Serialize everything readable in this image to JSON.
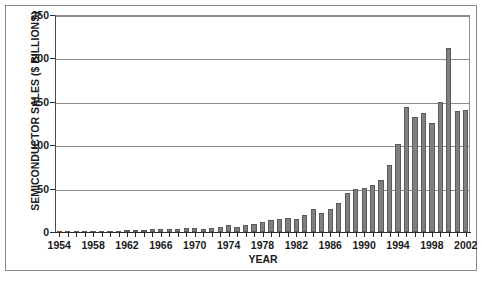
{
  "chart_data": {
    "type": "bar",
    "title": "",
    "xlabel": "YEAR",
    "ylabel": "SEMICONDUCTOR SALES ($ BILLIONS)",
    "ylim": [
      0,
      250
    ],
    "yticks": [
      0,
      50,
      100,
      150,
      200,
      250
    ],
    "ytick_labels": [
      "0",
      "50",
      "100",
      "150",
      "200",
      "250"
    ],
    "xlim": [
      1954,
      2002
    ],
    "xtick_labels": [
      "1954",
      "1958",
      "1962",
      "1966",
      "1970",
      "1974",
      "1978",
      "1982",
      "1986",
      "1990",
      "1994",
      "1998",
      "2002"
    ],
    "grid": "horizontal",
    "legend": "none",
    "bar_color": "#808080",
    "bar_edge_color": "#5a5a5a",
    "gridline_color": "#8c8c8c",
    "axis_color": "#2b2b2b",
    "categories": [
      "1954",
      "1955",
      "1956",
      "1957",
      "1958",
      "1959",
      "1960",
      "1961",
      "1962",
      "1963",
      "1964",
      "1965",
      "1966",
      "1967",
      "1968",
      "1969",
      "1970",
      "1971",
      "1972",
      "1973",
      "1974",
      "1975",
      "1976",
      "1977",
      "1978",
      "1979",
      "1980",
      "1981",
      "1982",
      "1983",
      "1984",
      "1985",
      "1986",
      "1987",
      "1988",
      "1989",
      "1990",
      "1991",
      "1992",
      "1993",
      "1994",
      "1995",
      "1996",
      "1997",
      "1998",
      "1999",
      "2000",
      "2001",
      "2002"
    ],
    "values": [
      0.1,
      0.2,
      0.3,
      0.4,
      0.5,
      0.7,
      0.9,
      1.1,
      2.0,
      2.3,
      2.6,
      2.9,
      3.6,
      3.4,
      3.6,
      4.4,
      4.3,
      4.0,
      4.6,
      6.3,
      7.6,
      6.2,
      7.7,
      8.9,
      11.2,
      14.0,
      15.4,
      15.8,
      15.5,
      20.0,
      26.0,
      21.8,
      26.0,
      33.0,
      45.0,
      49.0,
      50.5,
      54.6,
      59.9,
      77.3,
      101.9,
      144.4,
      132.0,
      137.2,
      125.6,
      149.4,
      212.0,
      139.0,
      141.0
    ],
    "value_unit": "$ Billions",
    "peak_year": "2000",
    "peak_value": 212.0
  },
  "axes": {
    "ylabel_text": "SEMICONDUCTOR SALES ($ BILLIONS)",
    "xlabel_text": "YEAR"
  }
}
